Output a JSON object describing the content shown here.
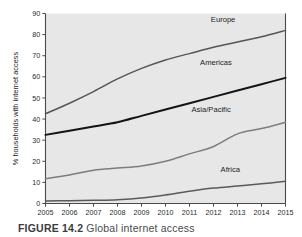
{
  "figure": {
    "caption_label": "FIGURE 14.2",
    "caption_text": "Global internet access"
  },
  "chart_data": {
    "type": "line",
    "title": "",
    "subtitle": "",
    "xlabel": "",
    "ylabel": "% households with internet access",
    "x": [
      2005,
      2006,
      2007,
      2008,
      2009,
      2010,
      2011,
      2012,
      2013,
      2014,
      2015
    ],
    "categories": [
      "2005",
      "2006",
      "2007",
      "2008",
      "2009",
      "2010",
      "2011",
      "2012",
      "2013",
      "2014",
      "2015"
    ],
    "xlim": [
      2005,
      2015
    ],
    "ylim": [
      0,
      90
    ],
    "yticks": [
      0,
      10,
      20,
      30,
      40,
      50,
      60,
      70,
      80,
      90
    ],
    "ytick_labels": [
      "0",
      "10",
      "20",
      "30",
      "40",
      "50",
      "60",
      "70",
      "80",
      "90"
    ],
    "grid": false,
    "legend_position": "inline-right",
    "plot_background": "#e7e7e7",
    "page_background": "#ffffff",
    "series": [
      {
        "name": "Europe",
        "label": "Europe",
        "color": "#555555",
        "width": 1.5,
        "values": [
          42.5,
          47.5,
          53.0,
          59.0,
          64.0,
          68.0,
          71.0,
          74.0,
          76.5,
          79.0,
          82.0
        ]
      },
      {
        "name": "Americas",
        "label": "Americas",
        "color": "#141414",
        "width": 2.0,
        "values": [
          32.5,
          34.5,
          36.5,
          38.5,
          41.5,
          44.5,
          47.5,
          50.5,
          53.5,
          56.5,
          59.5
        ]
      },
      {
        "name": "Asia/Pacific",
        "label": "Asia/Pacific",
        "color": "#7d7d7d",
        "width": 1.5,
        "values": [
          11.8,
          13.5,
          15.8,
          16.8,
          17.8,
          20.0,
          23.5,
          27.0,
          33.0,
          35.5,
          38.5
        ]
      },
      {
        "name": "Africa",
        "label": "Africa",
        "color": "#5a5a5a",
        "width": 1.5,
        "values": [
          1.2,
          1.3,
          1.5,
          1.8,
          2.6,
          4.0,
          5.8,
          7.3,
          8.3,
          9.3,
          10.5
        ]
      }
    ],
    "series_label_positions": [
      {
        "name": "Europe",
        "x": 2012.4,
        "y": 86.0
      },
      {
        "name": "Americas",
        "x": 2012.1,
        "y": 65.5
      },
      {
        "name": "Asia/Pacific",
        "x": 2011.9,
        "y": 43.5
      },
      {
        "name": "Africa",
        "x": 2012.7,
        "y": 15.0
      }
    ]
  }
}
